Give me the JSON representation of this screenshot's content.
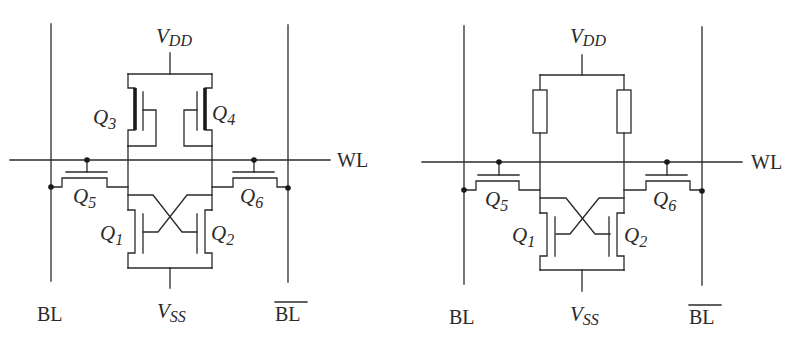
{
  "figure": {
    "colors": {
      "line": "#2a2a2a",
      "background": "#ffffff"
    }
  },
  "left_cell": {
    "type": "6T SRAM cell",
    "labels": {
      "vdd_main": "V",
      "vdd_sub": "DD",
      "vss_main": "V",
      "vss_sub": "SS",
      "wl": "WL",
      "bl": "BL",
      "bl_bar": "BL"
    },
    "transistors": [
      {
        "id": "Q1",
        "main": "Q",
        "sub": "1",
        "role": "pull-down NMOS (left)"
      },
      {
        "id": "Q2",
        "main": "Q",
        "sub": "2",
        "role": "pull-down NMOS (right)"
      },
      {
        "id": "Q3",
        "main": "Q",
        "sub": "3",
        "role": "pull-up PMOS (left)"
      },
      {
        "id": "Q4",
        "main": "Q",
        "sub": "4",
        "role": "pull-up PMOS (right)"
      },
      {
        "id": "Q5",
        "main": "Q",
        "sub": "5",
        "role": "access transistor (BL side)"
      },
      {
        "id": "Q6",
        "main": "Q",
        "sub": "6",
        "role": "access transistor (BL-bar side)"
      }
    ]
  },
  "right_cell": {
    "type": "4T resistive-load SRAM cell",
    "labels": {
      "vdd_main": "V",
      "vdd_sub": "DD",
      "vss_main": "V",
      "vss_sub": "SS",
      "wl": "WL",
      "bl": "BL",
      "bl_bar": "BL"
    },
    "loads": [
      "resistor-left",
      "resistor-right"
    ],
    "transistors": [
      {
        "id": "Q1",
        "main": "Q",
        "sub": "1",
        "role": "pull-down NMOS (left)"
      },
      {
        "id": "Q2",
        "main": "Q",
        "sub": "2",
        "role": "pull-down NMOS (right)"
      },
      {
        "id": "Q5",
        "main": "Q",
        "sub": "5",
        "role": "access transistor (BL side)"
      },
      {
        "id": "Q6",
        "main": "Q",
        "sub": "6",
        "role": "access transistor (BL-bar side)"
      }
    ]
  }
}
